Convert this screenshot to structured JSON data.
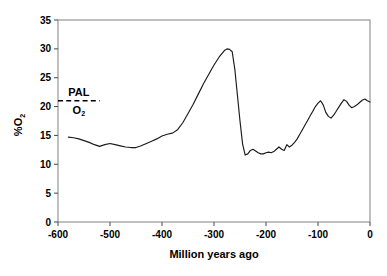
{
  "figure": {
    "background_color": "#ffffff",
    "line_color": "#1a1a1a",
    "axis_color": "#808080"
  },
  "annotations": {
    "pal_label": "PAL",
    "pal_sub_main": "O",
    "pal_sub_index": "2",
    "pal_value": 21
  },
  "axis_labels": {
    "x_title": "Million years ago",
    "y_title_main": "%O",
    "y_title_index": "2"
  },
  "chart_data": {
    "type": "line",
    "title": "",
    "subtitle": "",
    "xlabel": "Million years ago",
    "ylabel": "%O2",
    "xlim": [
      -600,
      0
    ],
    "ylim": [
      0,
      35
    ],
    "xticks": [
      -600,
      -500,
      -400,
      -300,
      -200,
      -100,
      0
    ],
    "xticklabels": [
      "-600",
      "-500",
      "-400",
      "-300",
      "-200",
      "-100",
      "0"
    ],
    "yticks": [
      0,
      5,
      10,
      15,
      20,
      25,
      30,
      35
    ],
    "yticklabels": [
      "0",
      "5",
      "10",
      "15",
      "20",
      "25",
      "30",
      "35"
    ],
    "grid": false,
    "legend": false,
    "legend_position": "none",
    "annotations": [
      {
        "type": "hline",
        "label": "PAL O2",
        "y": 21,
        "x_start": -600,
        "x_end": -520,
        "style": "dashed"
      }
    ],
    "series": [
      {
        "name": "Atmospheric O2",
        "x": [
          -580,
          -570,
          -560,
          -550,
          -540,
          -530,
          -520,
          -510,
          -500,
          -490,
          -480,
          -470,
          -460,
          -450,
          -440,
          -430,
          -420,
          -410,
          -400,
          -390,
          -380,
          -370,
          -360,
          -350,
          -340,
          -330,
          -320,
          -310,
          -300,
          -290,
          -280,
          -275,
          -270,
          -265,
          -260,
          -255,
          -250,
          -245,
          -240,
          -235,
          -230,
          -225,
          -220,
          -215,
          -210,
          -205,
          -200,
          -195,
          -190,
          -185,
          -180,
          -175,
          -170,
          -165,
          -160,
          -155,
          -150,
          -145,
          -140,
          -135,
          -130,
          -125,
          -120,
          -115,
          -110,
          -105,
          -100,
          -95,
          -90,
          -85,
          -80,
          -75,
          -70,
          -65,
          -60,
          -55,
          -50,
          -45,
          -40,
          -35,
          -30,
          -25,
          -20,
          -15,
          -10,
          -5,
          0
        ],
        "y": [
          14.7,
          14.6,
          14.4,
          14.1,
          13.8,
          13.4,
          13.1,
          13.4,
          13.6,
          13.4,
          13.2,
          13.0,
          12.9,
          12.9,
          13.2,
          13.6,
          14.0,
          14.4,
          14.9,
          15.2,
          15.4,
          16.0,
          17.2,
          18.8,
          20.4,
          22.2,
          24.0,
          25.6,
          27.2,
          28.6,
          29.7,
          30.0,
          29.9,
          29.5,
          26.5,
          22.0,
          17.5,
          13.5,
          11.6,
          11.8,
          12.4,
          12.6,
          12.3,
          12.0,
          11.8,
          11.8,
          12.0,
          12.1,
          12.0,
          12.2,
          12.6,
          13.0,
          12.6,
          12.4,
          13.4,
          13.0,
          13.3,
          13.8,
          14.4,
          15.2,
          16.0,
          16.8,
          17.6,
          18.4,
          19.2,
          20.0,
          20.6,
          21.0,
          20.3,
          19.0,
          18.3,
          18.0,
          18.5,
          19.2,
          19.9,
          20.6,
          21.2,
          20.9,
          20.2,
          19.8,
          20.0,
          20.3,
          20.7,
          21.1,
          21.3,
          21.0,
          20.8
        ]
      }
    ]
  }
}
